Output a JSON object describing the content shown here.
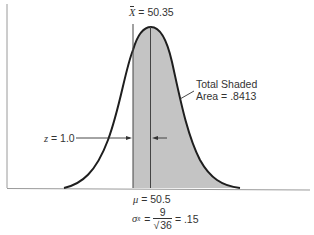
{
  "figure": {
    "xbar_label": {
      "symbol": "X",
      "equals": "= 50.35"
    },
    "shaded_label": {
      "line1": "Total Shaded",
      "line2": "Area = .8413"
    },
    "z_label": {
      "symbol": "z",
      "equals": "= 1.0"
    },
    "mu_label": {
      "symbol": "μ",
      "equals": "= 50.5"
    },
    "sigma_label": {
      "symbol": "σ",
      "subscript": "x̄",
      "equals": "=",
      "numerator": "9",
      "denominator": "36",
      "result": "= .15"
    },
    "colors": {
      "shade": "#c4c4c4",
      "curve": "#1e1e1e",
      "axis": "#8a8a8a",
      "line": "#333333"
    }
  }
}
